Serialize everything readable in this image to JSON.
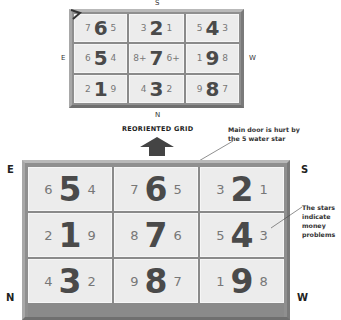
{
  "top_grid": {
    "compass": {
      "top": "S",
      "left": "E",
      "right": "W",
      "bottom": "N"
    },
    "cells": [
      {
        "left": "7",
        "center": "6",
        "right": "5"
      },
      {
        "left": "3",
        "center": "2",
        "right": "1"
      },
      {
        "left": "5",
        "center": "4",
        "right": "3"
      },
      {
        "left": "6",
        "center": "5",
        "right": "4"
      },
      {
        "left": "8+",
        "center": "7",
        "right": "6+"
      },
      {
        "left": "1",
        "center": "9",
        "right": "8"
      },
      {
        "left": "2",
        "center": "1",
        "right": "9"
      },
      {
        "left": "4",
        "center": "3",
        "right": "2"
      },
      {
        "left": "9",
        "center": "8",
        "right": "7"
      }
    ]
  },
  "caption": "REORIENTED GRID",
  "annotations": {
    "main_door": "Main door is hurt by the 5 water star",
    "main_door_lines": [
      "Main door is hurt by",
      "the 5 water star"
    ],
    "stars": "The stars indicate money problems",
    "stars_lines": [
      "The stars",
      "indicate",
      "money",
      "problems"
    ]
  },
  "bottom_grid": {
    "compass": {
      "top_left": "E",
      "top_right": "S",
      "bottom_left": "N",
      "bottom_right": "W"
    },
    "cells": [
      {
        "left": "6",
        "center": "5",
        "right": "4"
      },
      {
        "left": "7",
        "center": "6",
        "right": "5"
      },
      {
        "left": "3",
        "center": "2",
        "right": "1"
      },
      {
        "left": "2",
        "center": "1",
        "right": "9"
      },
      {
        "left": "8",
        "center": "7",
        "right": "6"
      },
      {
        "left": "5",
        "center": "4",
        "right": "3"
      },
      {
        "left": "4",
        "center": "3",
        "right": "2"
      },
      {
        "left": "9",
        "center": "8",
        "right": "7"
      },
      {
        "left": "1",
        "center": "9",
        "right": "8"
      }
    ]
  },
  "colors": {
    "frame": "#8f8f8f",
    "cell_bg": "#ececec",
    "big_digit": "#4a4a4a",
    "small_digit": "#777777",
    "arrow": "#444444"
  },
  "icons": {
    "corner_marker": "door-marker-icon",
    "up_arrow": "up-arrow-icon"
  }
}
